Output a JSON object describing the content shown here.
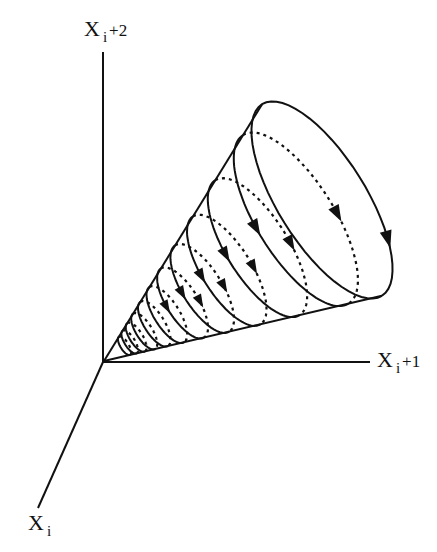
{
  "diagram": {
    "type": "3d-phase-space-cone",
    "axes": {
      "vertical": {
        "base": "X",
        "sub": "i",
        "suffix": "+2"
      },
      "horizontal": {
        "base": "X",
        "sub": "i",
        "suffix": "+1"
      },
      "diagonal": {
        "base": "X",
        "sub": "i",
        "suffix": ""
      }
    },
    "cone": {
      "apex": "origin",
      "loops": 11,
      "solid_front_arcs": true,
      "dashed_back_arcs": true,
      "direction_arrows": 9
    },
    "colors": {
      "ink": "#111111",
      "background": "#ffffff"
    }
  }
}
